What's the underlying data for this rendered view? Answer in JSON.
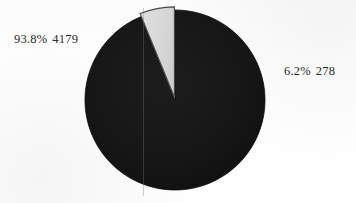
{
  "chart_data": {
    "type": "pie",
    "title": "",
    "subtitle": "",
    "xlabel": "",
    "ylabel": "",
    "legend_position": "none",
    "grid": false,
    "labels_show_percent_and_value": true,
    "start_angle_deg": 270,
    "direction": "clockwise",
    "categories": [
      "Major category",
      "Minor category"
    ],
    "values": [
      4179,
      278
    ],
    "percentages": [
      93.8,
      6.2
    ],
    "total": 4457,
    "slices": [
      {
        "name": "major-slice",
        "percent_text": "93.8%",
        "value_text": "4179",
        "percent": 93.8,
        "value": 4179,
        "color": "#151515",
        "exploded": false,
        "sweep_deg": 337.7,
        "label_side": "left"
      },
      {
        "name": "minor-slice",
        "percent_text": "6.2%",
        "value_text": "278",
        "percent": 6.2,
        "value": 278,
        "color": "#d7d7d7",
        "exploded": true,
        "sweep_deg": 22.3,
        "label_side": "right"
      }
    ],
    "colors": {
      "major": "#151515",
      "minor": "#d7d7d7",
      "outline": "#3a3a3a",
      "background": "#fefefe",
      "text": "#2b2b2b"
    },
    "geometry": {
      "center_x": 175,
      "center_y": 100,
      "radius": 90
    }
  },
  "labels": {
    "major": {
      "percent": "93.8%",
      "value": "4179"
    },
    "minor": {
      "percent": "6.2%",
      "value": "278"
    }
  }
}
